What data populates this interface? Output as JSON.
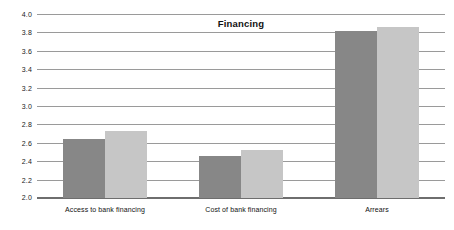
{
  "chart_data": {
    "type": "bar",
    "title": "Financing",
    "xlabel": "",
    "ylabel": "",
    "ylim": [
      2.0,
      4.0
    ],
    "ytick_step": 0.2,
    "yticks": [
      "4.0",
      "3.8",
      "3.6",
      "3.4",
      "3.2",
      "3.0",
      "2.8",
      "2.6",
      "2.4",
      "2.2",
      "2.0"
    ],
    "grid": true,
    "legend": "none",
    "categories": [
      "Access to bank financing",
      "Cost of bank financing",
      "Arrears"
    ],
    "series": [
      {
        "name": "series-1",
        "color": "#878787",
        "values": [
          2.64,
          2.46,
          3.82
        ]
      },
      {
        "name": "series-2",
        "color": "#c6c6c6",
        "values": [
          2.73,
          2.52,
          3.86
        ]
      }
    ]
  }
}
